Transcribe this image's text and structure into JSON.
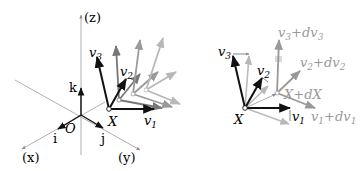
{
  "left_panel": {
    "axes": {
      "z_label": "(z)",
      "x_label": "(x)",
      "y_label": "(y)",
      "origin_label": "O"
    },
    "basis": {
      "i_label": "i",
      "j_label": "j",
      "k_label": "k"
    },
    "frame": {
      "point_label": "X",
      "v1_label": "v",
      "v1_sub": "1",
      "v2_label": "v",
      "v2_sub": "2",
      "v3_label": "v",
      "v3_sub": "3"
    }
  },
  "right_panel": {
    "frame": {
      "point_label": "X",
      "v1_label": "v",
      "v1_sub": "1",
      "v2_label": "v",
      "v2_sub": "2",
      "v3_label": "v",
      "v3_sub": "3"
    },
    "displaced_frame": {
      "point_label": "X+dX",
      "v1_label": "v",
      "v1_sub": "1",
      "v1_plus": "+dv",
      "v1_sub2": "1",
      "v2_label": "v",
      "v2_sub": "2",
      "v2_plus": "+dv",
      "v2_sub2": "2",
      "v3_label": "v",
      "v3_sub": "3",
      "v3_plus": "+dv",
      "v3_sub2": "3"
    }
  },
  "colors": {
    "black": "#111111",
    "axis": "#999999",
    "gray1": "#777777",
    "gray2": "#999999",
    "gray3": "#b5b5b5"
  }
}
